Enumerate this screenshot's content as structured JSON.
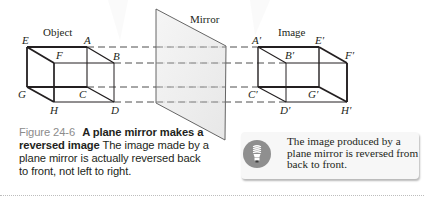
{
  "figure": {
    "labels": {
      "object": "Object",
      "mirror": "Mirror",
      "image": "Image"
    },
    "object_vertices": {
      "E": "E",
      "A": "A",
      "F": "F",
      "B": "B",
      "G": "G",
      "C": "C",
      "H": "H",
      "D": "D"
    },
    "image_vertices": {
      "A": "A′",
      "E": "E′",
      "B": "B′",
      "F": "F′",
      "C": "C′",
      "G": "G′",
      "D": "D′",
      "H": "H′"
    }
  },
  "caption": {
    "number": "Figure 24-6",
    "title": "A plane mirror makes a reversed image",
    "body": "The image made by a plane mirror is actually reversed back to front, not left to right."
  },
  "tip": {
    "icon": "lightbulb-icon",
    "text": "The image produced by a plane mirror is reversed from back to front."
  },
  "colors": {
    "line": "#231f20",
    "mirror_fill": "#ececec",
    "caption_number": "#8c8c8c",
    "tip_background": "#f7f7f7",
    "icon_circle": "#8f8f8f"
  }
}
